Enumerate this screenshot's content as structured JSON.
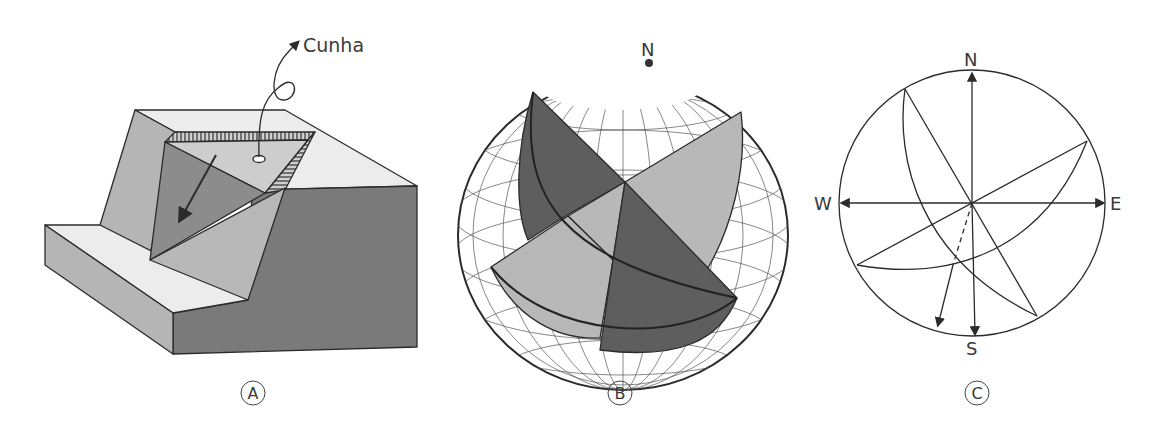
{
  "figure": {
    "panels": [
      {
        "id": "A",
        "label": "A",
        "description": "Block diagram of a rock slope with a wedge failure",
        "annotation": "Cunha"
      },
      {
        "id": "B",
        "label": "B",
        "description": "Stereographic net (sphere) with two intersecting planes",
        "north_label": "N"
      },
      {
        "id": "C",
        "label": "C",
        "description": "Stereographic projection of two planes and their line of intersection",
        "compass": {
          "north": "N",
          "south": "S",
          "east": "E",
          "west": "W"
        }
      }
    ]
  },
  "colors": {
    "line": "#2b2b2b",
    "dark_fill": "#6e6e6e",
    "mid_fill": "#a9a9a9",
    "light_fill": "#e8e8e8",
    "sphere_dark": "#5e5e5e",
    "sphere_light": "#b8b8b8"
  }
}
